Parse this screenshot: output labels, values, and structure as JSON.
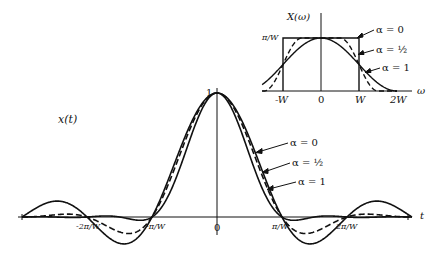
{
  "chart_data": [
    {
      "type": "line",
      "title": "x(t)",
      "ylabel": "x(t)",
      "xlabel": "t",
      "y_peak_label": "1",
      "x_ticks": [
        "-2π/W",
        "-π/W",
        "0",
        "π/W",
        "2π/W"
      ],
      "x_range_units_pi_over_W": [
        -3,
        3
      ],
      "series": [
        {
          "name": "α = 0",
          "alpha": 0,
          "style": "solid"
        },
        {
          "name": "α = ½",
          "alpha": 0.5,
          "style": "dashed"
        },
        {
          "name": "α = 1",
          "alpha": 1,
          "style": "solid"
        }
      ],
      "formula": "x(t) = sin(Wt)/(Wt) · cos(αWt)/(1 − (2αWt/π)²)",
      "annotations": [
        "α = 0",
        "α = ½",
        "α = 1"
      ]
    },
    {
      "type": "line",
      "title": "X(ω)",
      "ylabel": "X(ω)",
      "xlabel": "ω",
      "y_level_label": "π/W",
      "x_ticks": [
        "-W",
        "0",
        "W",
        "2W"
      ],
      "series": [
        {
          "name": "α = 0",
          "alpha": 0,
          "style": "solid",
          "shape": "rectangle"
        },
        {
          "name": "α = ½",
          "alpha": 0.5,
          "style": "dashed",
          "shape": "raised-cosine"
        },
        {
          "name": "α = 1",
          "alpha": 1,
          "style": "solid",
          "shape": "raised-cosine"
        }
      ],
      "annotations": [
        "α = 0",
        "α = ½",
        "α = 1"
      ]
    }
  ],
  "main": {
    "ylabel": "x(t)",
    "peak": "1",
    "t_label": "t",
    "ticks": {
      "m2": "-2π/W",
      "m1": "-π/W",
      "zero": "0",
      "p1": "π/W",
      "p2": "2π/W"
    },
    "legend": {
      "a0": "α = 0",
      "ahalf": "α = ½",
      "a1": "α = 1"
    }
  },
  "inset": {
    "ylabel": "X(ω)",
    "level": "π/W",
    "w_label": "ω",
    "ticks": {
      "mW": "-W",
      "zero": "0",
      "W": "W",
      "W2": "2W"
    },
    "legend": {
      "a0": "α = 0",
      "ahalf": "α = ½",
      "a1": "α = 1"
    }
  },
  "colors": {
    "ink": "#111111",
    "background": "#ffffff"
  }
}
